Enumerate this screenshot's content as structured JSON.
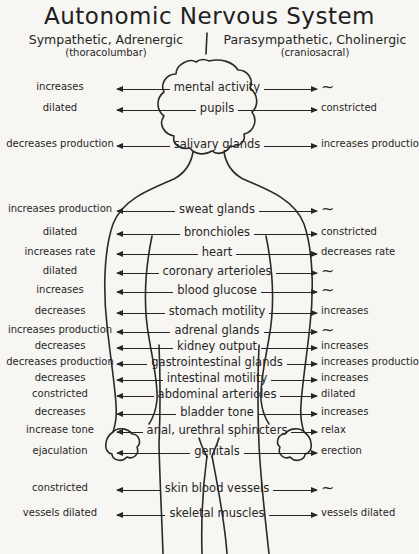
{
  "title": "Autonomic Nervous System",
  "header": {
    "left": {
      "label": "Sympathetic, Adrenergic",
      "sublabel": "(thoracolumbar)"
    },
    "right": {
      "label": "Parasympathetic, Cholinergic",
      "sublabel": "(craniosacral)"
    }
  },
  "figure": {
    "icon": "human-body-outline"
  },
  "rows": [
    {
      "left": "increases",
      "organ": "mental activity",
      "right": "~"
    },
    {
      "left": "dilated",
      "organ": "pupils",
      "right": "constricted"
    },
    {
      "left": "decreases production",
      "organ": "salivary glands",
      "right": "increases production"
    },
    {
      "left": "increases production",
      "organ": "sweat glands",
      "right": "~"
    },
    {
      "left": "dilated",
      "organ": "bronchioles",
      "right": "constricted"
    },
    {
      "left": "increases rate",
      "organ": "heart",
      "right": "decreases rate"
    },
    {
      "left": "dilated",
      "organ": "coronary arterioles",
      "right": "~"
    },
    {
      "left": "increases",
      "organ": "blood glucose",
      "right": "~"
    },
    {
      "left": "decreases",
      "organ": "stomach motility",
      "right": "increases"
    },
    {
      "left": "increases production",
      "organ": "adrenal glands",
      "right": "~"
    },
    {
      "left": "decreases",
      "organ": "kidney output",
      "right": "increases"
    },
    {
      "left": "decreases production",
      "organ": "gastrointestinal glands",
      "right": "increases production"
    },
    {
      "left": "decreases",
      "organ": "intestinal motility",
      "right": "increases"
    },
    {
      "left": "constricted",
      "organ": "abdominal arterioles",
      "right": "dilated"
    },
    {
      "left": "decreases",
      "organ": "bladder tone",
      "right": "increases"
    },
    {
      "left": "increase tone",
      "organ": "anal, urethral sphincters",
      "right": "relax"
    },
    {
      "left": "ejaculation",
      "organ": "genitals",
      "right": "erection"
    },
    {
      "left": "constricted",
      "organ": "skin blood vessels",
      "right": "~"
    },
    {
      "left": "vessels dilated",
      "organ": "skeletal muscles",
      "right": "vessels dilated"
    }
  ],
  "colors": {
    "ink": "#262626",
    "paper": "#f7f6f3"
  }
}
